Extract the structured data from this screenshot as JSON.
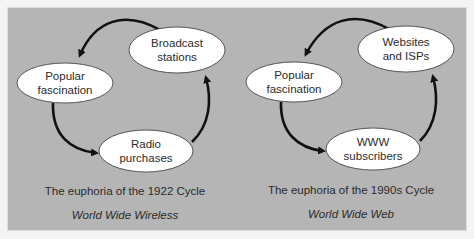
{
  "colors": {
    "panel_background": "#b5b5b5",
    "node_fill": "#ffffff",
    "arrow": "#111111",
    "text": "#2c2c2c"
  },
  "cycles": [
    {
      "nodes": [
        {
          "label": "Broadcast\nstations"
        },
        {
          "label": "Popular\nfascination"
        },
        {
          "label": "Radio\npurchases"
        }
      ],
      "caption": "The euphoria of the 1922 Cycle",
      "subtitle": "World Wide Wireless"
    },
    {
      "nodes": [
        {
          "label": "Websites\nand ISPs"
        },
        {
          "label": "Popular\nfascination"
        },
        {
          "label": "WWW\nsubscribers"
        }
      ],
      "caption": "The euphoria of the 1990s Cycle",
      "subtitle": "World Wide Web"
    }
  ]
}
